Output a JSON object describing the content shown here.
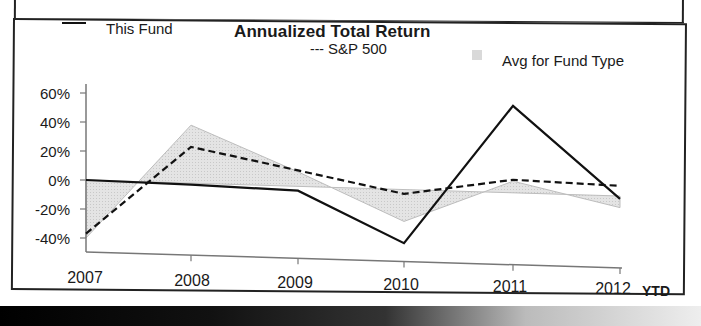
{
  "chart_data": {
    "type": "line",
    "title": "Annualized Total Return",
    "xlabel": "",
    "ylabel": "",
    "categories": [
      "2007",
      "2008",
      "2009",
      "2010",
      "2011",
      "2012"
    ],
    "x_suffix_label": "YTD",
    "yticks": [
      "60%",
      "40%",
      "20%",
      "0%",
      "-20%",
      "-40%"
    ],
    "ylim": [
      -45,
      65
    ],
    "grid": false,
    "legend_position": "top",
    "series": [
      {
        "name": "This Fund",
        "style": "solid-line",
        "values": [
          0,
          -1,
          -3,
          -37,
          60,
          -2
        ]
      },
      {
        "name": "S&P 500",
        "style": "dashed-line",
        "values": [
          -37,
          25,
          11,
          -3,
          9,
          7
        ]
      },
      {
        "name": "Avg for Fund Type",
        "style": "shaded-area",
        "values": [
          -40,
          40,
          10,
          -22,
          8,
          -8
        ]
      }
    ]
  },
  "legend": {
    "this_fund": "This Fund",
    "sp500_prefix": "---",
    "sp500": "S&P 500",
    "avg_fund_type": "Avg for Fund Type"
  },
  "colors": {
    "line": "#111111",
    "area_fill": "#d9d9d9",
    "axis": "#777777"
  }
}
